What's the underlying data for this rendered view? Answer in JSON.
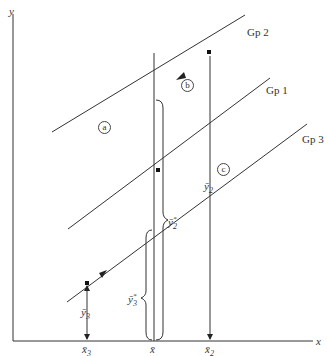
{
  "diagram": {
    "axes": {
      "y_label": "y",
      "x_label": "x"
    },
    "groups": [
      {
        "id": "gp2",
        "label": "Gp 2"
      },
      {
        "id": "gp1",
        "label": "Gp 1"
      },
      {
        "id": "gp3",
        "label": "Gp 3"
      }
    ],
    "markers": {
      "a": "a",
      "b": "b",
      "c": "c"
    },
    "x_ticks": {
      "x3": "x̄",
      "x3_sub": "3",
      "xbar": "x̄",
      "x2": "x̄",
      "x2_sub": "2"
    },
    "y_annotations": {
      "y3": "ȳ",
      "y3_sub": "3",
      "y3_adj": "ȳ",
      "y3_adj_sub": "3",
      "y3_adj_sup": "*",
      "y2": "ȳ",
      "y2_sub": "2",
      "y2_adj": "ȳ",
      "y2_adj_sub": "2",
      "y2_adj_sup": "*"
    },
    "colors": {
      "line": "#333333",
      "background": "#ffffff"
    }
  }
}
